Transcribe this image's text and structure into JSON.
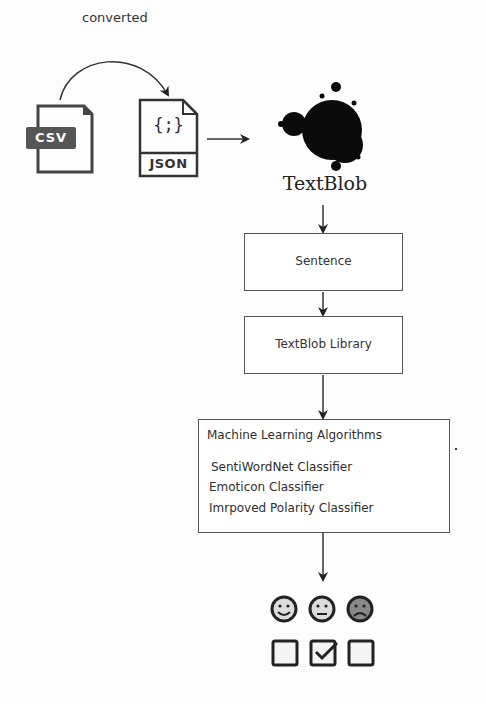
{
  "diagram": {
    "converted_label": "converted",
    "csv_label": "CSV",
    "json_label": "JSON",
    "json_glyph": "{;}",
    "textblob_logo_label": "TextBlob",
    "steps": [
      {
        "label": "Sentence"
      },
      {
        "label": "TextBlob Library"
      }
    ],
    "ml_box": {
      "title": "Machine Learning Algorithms",
      "items": [
        "SentiWordNet Classifier",
        "Emoticon Classifier",
        "Imrpoved Polarity Classifier"
      ],
      "icon": "gears-icon"
    },
    "outputs": [
      {
        "sentiment": "positive",
        "icon": "smiley-happy-icon",
        "checked": false
      },
      {
        "sentiment": "neutral",
        "icon": "smiley-neutral-icon",
        "checked": true
      },
      {
        "sentiment": "negative",
        "icon": "smiley-sad-icon",
        "checked": false
      }
    ],
    "colors": {
      "line": "#333333",
      "box_border": "#555555",
      "csv_badge": "#555555"
    }
  }
}
